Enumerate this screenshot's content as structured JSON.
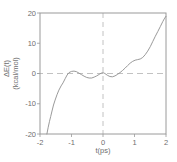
{
  "figure": {
    "description_colors": {
      "background": "#ffffff",
      "axis": "#9a9a9a",
      "dash": "#b3b3b3",
      "line": "#8f8f8f",
      "text": "#6e6e6e"
    }
  },
  "chart_data": {
    "type": "line",
    "title": "",
    "xlabel": "t(ps)",
    "ylabel": "ΔE(t)",
    "ylabel_units": "(kcal/mol)",
    "xlim": [
      -2,
      2
    ],
    "ylim": [
      -20,
      20
    ],
    "xticks": [
      -2,
      -1,
      0,
      1,
      2
    ],
    "yticks": [
      20,
      10,
      0,
      -10,
      -20
    ],
    "grid": false,
    "legend": "none",
    "reference_lines": [
      {
        "axis": "y",
        "value": 0,
        "style": "dashed"
      },
      {
        "axis": "x",
        "value": 0,
        "style": "dashed"
      }
    ],
    "series": [
      {
        "name": "energy-gap-relaxation",
        "x": [
          -1.78,
          -1.74,
          -1.7,
          -1.66,
          -1.62,
          -1.57,
          -1.52,
          -1.46,
          -1.4,
          -1.33,
          -1.27,
          -1.2,
          -1.14,
          -1.08,
          -1.0,
          -0.92,
          -0.84,
          -0.76,
          -0.68,
          -0.6,
          -0.52,
          -0.44,
          -0.36,
          -0.28,
          -0.2,
          -0.12,
          -0.06,
          0.0,
          0.06,
          0.14,
          0.22,
          0.3,
          0.38,
          0.46,
          0.54,
          0.62,
          0.7,
          0.78,
          0.86,
          0.94,
          1.02,
          1.1,
          1.18,
          1.26,
          1.34,
          1.42,
          1.5,
          1.58,
          1.66,
          1.74,
          1.82,
          1.9,
          1.96,
          2.0
        ],
        "y": [
          -20.0,
          -17.8,
          -15.8,
          -14.2,
          -12.4,
          -10.4,
          -8.8,
          -7.0,
          -5.5,
          -4.1,
          -3.1,
          -1.7,
          -0.5,
          0.3,
          0.7,
          0.8,
          0.6,
          0.1,
          -0.4,
          -0.9,
          -1.3,
          -1.5,
          -1.5,
          -1.2,
          -0.8,
          -0.3,
          0.1,
          0.3,
          0.0,
          -0.6,
          -1.0,
          -1.1,
          -0.8,
          -0.3,
          0.3,
          1.0,
          1.8,
          2.6,
          3.4,
          4.0,
          4.4,
          4.6,
          4.8,
          5.3,
          6.2,
          7.4,
          8.9,
          10.6,
          12.3,
          13.9,
          15.5,
          17.2,
          18.3,
          18.9
        ]
      }
    ]
  }
}
